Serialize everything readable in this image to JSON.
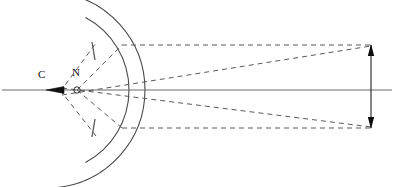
{
  "figure": {
    "type": "optical-ray-diagram",
    "title": "",
    "width": 394,
    "height": 187,
    "background_color": "#ffffff",
    "line_color": "#4a4a4a",
    "dash_color": "#5a5a5a",
    "ink_color": "#111111"
  },
  "labels": {
    "center_of_curvature": "C",
    "nodal_point": "N"
  },
  "chart_data": {
    "type": "diagram",
    "title": "",
    "xlabel": "",
    "ylabel": "",
    "axis": {
      "name": "optical-axis",
      "y": 90,
      "x_start": 2,
      "x_end": 392,
      "style": "solid"
    },
    "points": [
      {
        "name": "C",
        "label": "C",
        "x": 47,
        "y": 90,
        "label_x": 38,
        "label_y": 78
      },
      {
        "name": "N",
        "label": "N",
        "x": 77,
        "y": 90,
        "label_x": 72,
        "label_y": 76
      }
    ],
    "arcs": [
      {
        "name": "outer-sphere-arc",
        "cx": 47,
        "cy": 90,
        "r": 98,
        "start_deg": -84,
        "end_deg": 84,
        "style": "solid"
      },
      {
        "name": "refracting-surface-arc",
        "cx": 47,
        "cy": 90,
        "r": 82,
        "start_deg": -62,
        "end_deg": 62,
        "style": "solid"
      }
    ],
    "ticks": [
      {
        "name": "upper-tick",
        "x1": 92,
        "y1": 42,
        "x2": 95,
        "y2": 60
      },
      {
        "name": "lower-tick",
        "x1": 92,
        "y1": 137,
        "x2": 95,
        "y2": 119
      }
    ],
    "rays": [
      {
        "name": "upper-horizontal-ray",
        "x1": 122,
        "y1": 45,
        "x2": 371,
        "y2": 45,
        "style": "dashed"
      },
      {
        "name": "lower-horizontal-ray",
        "x1": 122,
        "y1": 128,
        "x2": 371,
        "y2": 128,
        "style": "dashed"
      },
      {
        "name": "upper-oblique-ray",
        "x1": 62,
        "y1": 95,
        "x2": 371,
        "y2": 46,
        "style": "dashed"
      },
      {
        "name": "lower-oblique-ray",
        "x1": 62,
        "y1": 88,
        "x2": 371,
        "y2": 127,
        "style": "dashed"
      },
      {
        "name": "nodal-upper-chief-ray",
        "x1": 77,
        "y1": 90,
        "x2": 122,
        "y2": 45,
        "style": "dashed"
      },
      {
        "name": "nodal-lower-chief-ray",
        "x1": 77,
        "y1": 90,
        "x2": 122,
        "y2": 128,
        "style": "dashed"
      },
      {
        "name": "center-upper-radius",
        "x1": 60,
        "y1": 92,
        "x2": 96,
        "y2": 43,
        "style": "dashed"
      },
      {
        "name": "center-lower-radius",
        "x1": 60,
        "y1": 90,
        "x2": 96,
        "y2": 136,
        "style": "dashed"
      }
    ],
    "image_arrow": {
      "name": "image-arrow",
      "x": 371,
      "y_top": 45,
      "y_bottom": 128,
      "head_top": "up",
      "head_bottom": "down",
      "style": "solid"
    },
    "grid": false,
    "legend": null
  }
}
